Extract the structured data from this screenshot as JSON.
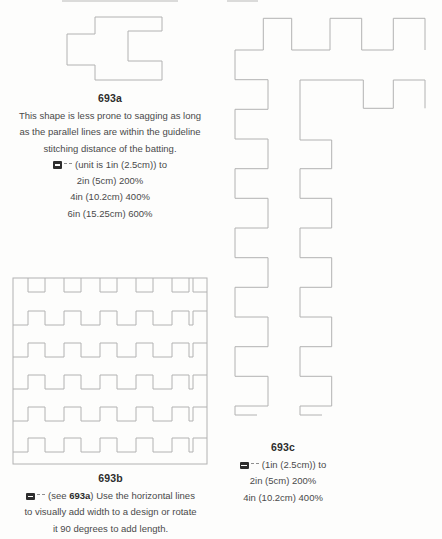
{
  "page": {
    "background": "#fdfdfc",
    "line_color": "#b2b2b2",
    "text_color": "#4a4a4a"
  },
  "figure_a": {
    "label": "693a",
    "description_lines": [
      "This shape is less prone to sagging as long",
      "as the parallel lines are within the guideline",
      "stitching distance of the batting."
    ],
    "enlarge_intro": "(unit is 1in (2.5cm)) to",
    "enlarge_lines": [
      "2in (5cm) 200%",
      "4in (10.2cm) 400%",
      "6in (15.25cm) 600%"
    ]
  },
  "figure_b": {
    "label": "693b",
    "note_prefix": "(see ",
    "note_ref": "693a",
    "note_suffix": ") Use the horizontal lines",
    "note_lines": [
      "to visually add width to a design or rotate",
      "it 90 degrees to add length."
    ]
  },
  "figure_c": {
    "label": "693c",
    "enlarge_intro": "(1in (2.5cm)) to",
    "enlarge_lines": [
      "2in (5cm) 200%",
      "4in (10.2cm) 400%"
    ]
  },
  "icons": {
    "copier": "photocopy-enlarge",
    "marks": "enlarge-tick-marks"
  }
}
